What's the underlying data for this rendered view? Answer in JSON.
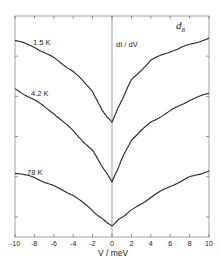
{
  "chart_data": {
    "type": "line",
    "title": "",
    "panel_label": "d",
    "panel_label_subscript": "8",
    "annotation": "dI / dV",
    "xlabel": "V / meV",
    "ylabel": "",
    "xlim": [
      -10,
      10
    ],
    "ylim": [
      0,
      1
    ],
    "x_ticks": [
      -10,
      -8,
      -6,
      -4,
      -2,
      0,
      2,
      4,
      6,
      8,
      10
    ],
    "x_tick_labels": [
      "-10",
      "-8",
      "-6",
      "-4",
      "-2",
      "0",
      "2",
      "4",
      "6",
      "8",
      "10"
    ],
    "y_ticks_unlabeled": 5,
    "grid": false,
    "legend": "inline curve labels",
    "x": [
      -10,
      -8,
      -6,
      -4,
      -2,
      -1,
      0,
      1,
      2,
      4,
      6,
      8,
      10
    ],
    "series": [
      {
        "name": "1.5 K",
        "values": [
          0.89,
          0.86,
          0.81,
          0.75,
          0.66,
          0.57,
          0.52,
          0.62,
          0.71,
          0.8,
          0.84,
          0.87,
          0.9
        ]
      },
      {
        "name": "4.2 K",
        "values": [
          0.67,
          0.62,
          0.56,
          0.48,
          0.39,
          0.32,
          0.25,
          0.35,
          0.44,
          0.52,
          0.57,
          0.62,
          0.65
        ]
      },
      {
        "name": "78 K",
        "values": [
          0.29,
          0.27,
          0.23,
          0.19,
          0.12,
          0.08,
          0.05,
          0.09,
          0.12,
          0.18,
          0.23,
          0.27,
          0.3
        ]
      }
    ]
  },
  "labels": {
    "curve_1": "1.5 K",
    "curve_2": "4.2 K",
    "curve_3": "78 K",
    "annotation": "dI / dV",
    "panel": "d",
    "panel_sub": "8",
    "xlabel": "V / meV"
  }
}
